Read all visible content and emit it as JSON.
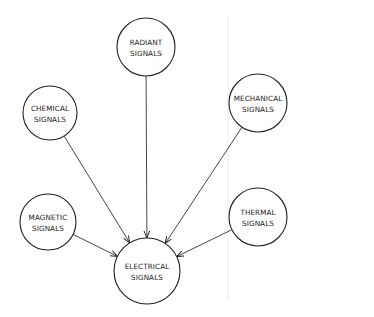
{
  "diagram": {
    "type": "hub-diagram",
    "colors": {
      "stroke": "#222222",
      "background": "#ffffff",
      "faint_rule": "#e6e6e6"
    },
    "nodes": [
      {
        "id": "radiant",
        "line1": "RADIANT",
        "line2": "SIGNALS",
        "cx": 146,
        "cy": 47,
        "r": 29
      },
      {
        "id": "chemical",
        "line1": "CHEMICAL",
        "line2": "SIGNALS",
        "cx": 50,
        "cy": 113,
        "r": 27
      },
      {
        "id": "mechanical",
        "line1": "MECHANICAL",
        "line2": "SIGNALS",
        "cx": 258,
        "cy": 103,
        "r": 29
      },
      {
        "id": "magnetic",
        "line1": "MAGNETIC",
        "line2": "SIGNALS",
        "cx": 48,
        "cy": 222,
        "r": 28
      },
      {
        "id": "thermal",
        "line1": "THERMAL",
        "line2": "SIGNALS",
        "cx": 258,
        "cy": 217,
        "r": 29
      },
      {
        "id": "electrical",
        "line1": "ELECTRICAL",
        "line2": "SIGNALS",
        "cx": 147,
        "cy": 271,
        "r": 33
      }
    ],
    "edges": [
      {
        "from": "radiant",
        "to": "electrical"
      },
      {
        "from": "chemical",
        "to": "electrical"
      },
      {
        "from": "mechanical",
        "to": "electrical"
      },
      {
        "from": "magnetic",
        "to": "electrical"
      },
      {
        "from": "thermal",
        "to": "electrical"
      }
    ]
  }
}
